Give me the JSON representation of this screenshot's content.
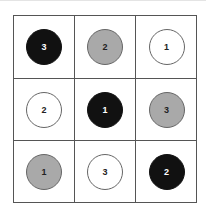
{
  "grid": {
    "rows": 3,
    "cols": 3,
    "cells": [
      {
        "color": "black",
        "label": "3"
      },
      {
        "color": "gray",
        "label": "2"
      },
      {
        "color": "white",
        "label": "1"
      },
      {
        "color": "white",
        "label": "2"
      },
      {
        "color": "black",
        "label": "1"
      },
      {
        "color": "gray",
        "label": "3"
      },
      {
        "color": "gray",
        "label": "1"
      },
      {
        "color": "white",
        "label": "3"
      },
      {
        "color": "black",
        "label": "2"
      }
    ]
  },
  "colors": {
    "black": "#111111",
    "gray": "#a9a9a9",
    "white": "#ffffff",
    "grid_line": "#555555"
  }
}
